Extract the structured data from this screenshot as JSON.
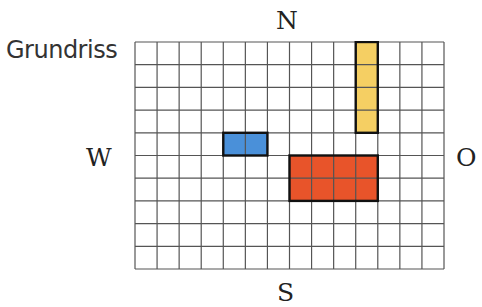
{
  "title": "Grundriss",
  "directions": {
    "north": "N",
    "south": "S",
    "west": "W",
    "east": "O"
  },
  "grid": {
    "columns": 14,
    "rows": 10,
    "line_color": "#555555",
    "background": "#ffffff"
  },
  "blocks": [
    {
      "name": "blue-block",
      "color": "#4a90d9",
      "col": 4,
      "row": 4,
      "width": 2,
      "height": 1
    },
    {
      "name": "yellow-block",
      "color": "#f5cf63",
      "col": 10,
      "row": 0,
      "width": 1,
      "height": 4
    },
    {
      "name": "red-block",
      "color": "#e8542a",
      "col": 7,
      "row": 5,
      "width": 4,
      "height": 2
    }
  ]
}
